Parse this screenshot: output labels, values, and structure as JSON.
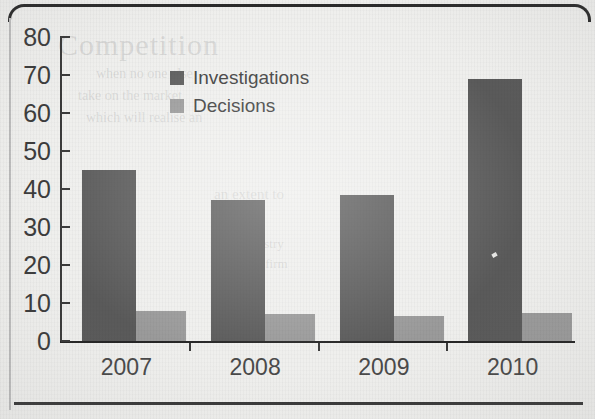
{
  "chart_data": {
    "type": "bar",
    "title": "",
    "xlabel": "",
    "ylabel": "",
    "categories": [
      "2007",
      "2008",
      "2009",
      "2010"
    ],
    "series": [
      {
        "name": "Investigations",
        "color": "#5a5a5a",
        "values": [
          45,
          37,
          38.5,
          69
        ]
      },
      {
        "name": "Decisions",
        "color": "#9a9a9a",
        "values": [
          8,
          7,
          6.5,
          7.5
        ]
      }
    ],
    "ylim": [
      0,
      80
    ],
    "yticks": [
      0,
      10,
      20,
      30,
      40,
      50,
      60,
      70,
      80
    ],
    "ytick_labels": [
      "0",
      "10",
      "20",
      "30",
      "40",
      "50",
      "60",
      "70",
      "80"
    ],
    "grid": false,
    "legend_position": "top-center"
  },
  "legend": {
    "items": [
      {
        "label": "Investigations",
        "swatch": "#5a5a5a"
      },
      {
        "label": "Decisions",
        "swatch": "#9a9a9a"
      }
    ]
  },
  "page": {
    "background": "#efefed",
    "frame_color": "#2b2b2b",
    "axis_color": "#3a3a3a",
    "footer_text": "",
    "ghost_text": {
      "title": "Competition",
      "line1": "when no one else",
      "line2": "take on the market",
      "line3": "which will realise an",
      "line4": "an extent to",
      "line5": "the industry",
      "line6": "of the firm"
    }
  }
}
